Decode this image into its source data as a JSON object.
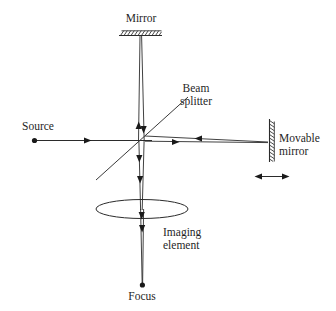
{
  "figure": {
    "background_color": "#ffffff",
    "line_color": "#2b2b2b",
    "text_color": "#1f1f1f",
    "width": 336,
    "height": 311
  },
  "labels": {
    "mirror": "Mirror",
    "beam_splitter_line1": "Beam",
    "beam_splitter_line2": "splitter",
    "source": "Source",
    "movable_mirror_line1": "Movable",
    "movable_mirror_line2": "mirror",
    "imaging_element_line1": "Imaging",
    "imaging_element_line2": "element",
    "focus": "Focus"
  },
  "components": [
    {
      "name": "fixed-mirror",
      "label": "Mirror",
      "kind": "hatched-mirror",
      "orientation": "horizontal",
      "position": {
        "x": 140,
        "y": 34
      }
    },
    {
      "name": "beam-splitter",
      "label": "Beam splitter",
      "kind": "diagonal-plate",
      "orientation": "diagonal-45",
      "position": {
        "x": 140,
        "y": 140
      }
    },
    {
      "name": "source",
      "label": "Source",
      "kind": "point-source",
      "position": {
        "x": 34,
        "y": 140
      }
    },
    {
      "name": "movable-mirror",
      "label": "Movable mirror",
      "kind": "hatched-mirror",
      "orientation": "vertical",
      "position": {
        "x": 272,
        "y": 140
      },
      "motion": "horizontal-translation"
    },
    {
      "name": "imaging-element",
      "label": "Imaging element",
      "kind": "lens",
      "position": {
        "x": 142,
        "y": 209
      }
    },
    {
      "name": "focus",
      "label": "Focus",
      "kind": "point-focus",
      "position": {
        "x": 142,
        "y": 285
      }
    }
  ],
  "beam_paths": [
    {
      "name": "source-to-splitter",
      "direction": "right"
    },
    {
      "name": "splitter-to-fixed-mirror",
      "direction": "up"
    },
    {
      "name": "fixed-mirror-to-splitter",
      "direction": "down"
    },
    {
      "name": "splitter-to-movable-mirror",
      "direction": "right"
    },
    {
      "name": "movable-mirror-to-splitter",
      "direction": "left"
    },
    {
      "name": "splitter-to-lens",
      "direction": "down"
    },
    {
      "name": "lens-to-focus",
      "direction": "down"
    }
  ]
}
